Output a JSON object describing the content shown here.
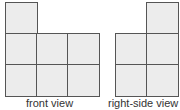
{
  "front_view": {
    "label": "front view",
    "grid": [
      [
        1,
        0,
        0
      ],
      [
        1,
        1,
        1
      ],
      [
        1,
        1,
        1
      ]
    ]
  },
  "right_side_view": {
    "label": "right-side view",
    "grid": [
      [
        0,
        1
      ],
      [
        1,
        1
      ],
      [
        1,
        1
      ]
    ]
  },
  "colors": {
    "cell_fill": "#ececec",
    "cell_border": "#555555"
  }
}
